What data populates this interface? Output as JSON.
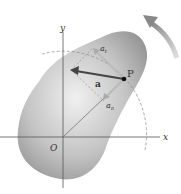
{
  "diagram": {
    "type": "rigid-body-acceleration",
    "labels": {
      "x_axis": "x",
      "y_axis": "y",
      "origin": "O",
      "point": "P",
      "acceleration": "a",
      "tangential": "a",
      "tangential_sub": "t",
      "normal": "a",
      "normal_sub": "n"
    },
    "colors": {
      "body": "#9a9a9a",
      "body_light": "#e6e6e6",
      "axis": "#555555",
      "vector": "#444444",
      "component": "#bbbbbb",
      "rotation_arrow": "#888888"
    }
  }
}
